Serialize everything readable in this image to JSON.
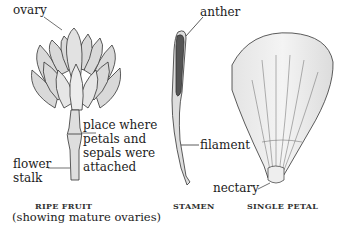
{
  "figure": {
    "fruit": {
      "labels": {
        "ovary": "ovary",
        "attachment": [
          "place where",
          "petals and",
          "sepals were",
          "attached"
        ],
        "stalk": [
          "flower",
          "stalk"
        ]
      },
      "caption": "RIPE FRUIT",
      "subcaption": "(showing mature ovaries)"
    },
    "stamen": {
      "labels": {
        "anther": "anther",
        "filament": "filament"
      },
      "caption": "STAMEN"
    },
    "petal": {
      "labels": {
        "nectary": "nectary"
      },
      "caption": "SINGLE PETAL"
    }
  }
}
